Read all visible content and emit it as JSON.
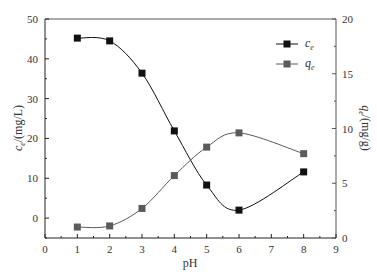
{
  "chart_data": {
    "type": "line",
    "title": "",
    "xlabel": "pH",
    "ylabel": "c_e/(mg/L)",
    "y2label": "q_e/(mg/g)",
    "xlim": [
      0,
      9
    ],
    "ylim": [
      -5,
      50
    ],
    "y2lim": [
      0,
      20
    ],
    "x_ticks": [
      "0",
      "1",
      "2",
      "3",
      "4",
      "5",
      "6",
      "7",
      "8",
      "9"
    ],
    "y_ticks": [
      "0",
      "10",
      "20",
      "30",
      "40",
      "50"
    ],
    "y2_ticks": [
      "0",
      "5",
      "10",
      "15",
      "20"
    ],
    "grid": false,
    "legend_position": "upper right",
    "x": [
      1,
      2,
      3,
      4,
      5,
      6,
      8
    ],
    "series": [
      {
        "name": "c_e",
        "label_main": "c",
        "label_sub": "e",
        "axis": "left",
        "color": "#111111",
        "marker": "square",
        "values": [
          45.2,
          44.5,
          36.4,
          21.9,
          8.3,
          2.0,
          11.6
        ]
      },
      {
        "name": "q_e",
        "label_main": "q",
        "label_sub": "e",
        "axis": "right",
        "color": "#5a5a5a",
        "marker": "square",
        "values": [
          1.0,
          1.1,
          2.7,
          5.7,
          8.3,
          9.6,
          7.7
        ]
      }
    ]
  }
}
